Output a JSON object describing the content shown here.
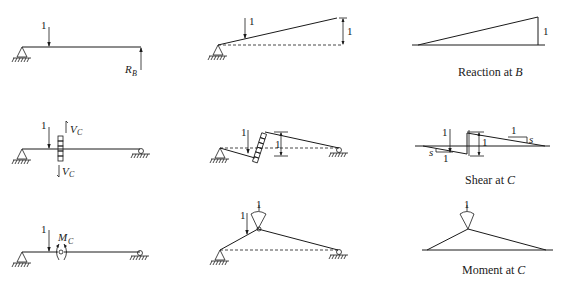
{
  "figure": {
    "rows": [
      {
        "id": "reaction",
        "caption": {
          "text": "Reaction at ",
          "var": "B"
        },
        "released_structure": {
          "load_label": "1",
          "reaction_label": "R",
          "reaction_sub": "B"
        },
        "deflected_shape": {
          "load_label": "1",
          "ordinate_label": "1"
        },
        "influence_line": {
          "ordinate_label": "1"
        }
      },
      {
        "id": "shear",
        "caption": {
          "text": "Shear at ",
          "var": "C"
        },
        "released_structure": {
          "load_label": "1",
          "shear_top_label": "V",
          "shear_top_sub": "C",
          "shear_bottom_label": "V",
          "shear_bottom_sub": "C"
        },
        "deflected_shape": {
          "load_label": "1",
          "ordinate_label": "1"
        },
        "influence_line": {
          "load_label": "1",
          "jump_label": "1",
          "slope_right_run": "1",
          "slope_right_rise": "s",
          "slope_left_run": "1",
          "slope_left_rise": "s"
        }
      },
      {
        "id": "moment",
        "caption": {
          "text": "Moment at ",
          "var": "C"
        },
        "released_structure": {
          "load_label": "1",
          "moment_label": "M",
          "moment_sub": "C"
        },
        "deflected_shape": {
          "load_label": "1",
          "rotation_label": "1"
        },
        "influence_line": {
          "rotation_label": "1"
        }
      }
    ]
  }
}
